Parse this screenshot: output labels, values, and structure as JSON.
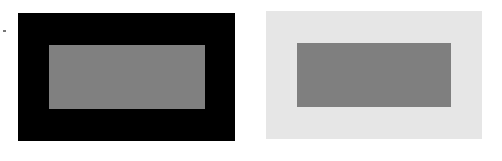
{
  "figure": {
    "panels": [
      {
        "name": "dark-surround",
        "surround_color": "#000000",
        "inner_color": "#808080"
      },
      {
        "name": "light-surround",
        "surround_color": "#e6e6e6",
        "inner_color": "#7f7f7f"
      }
    ]
  }
}
